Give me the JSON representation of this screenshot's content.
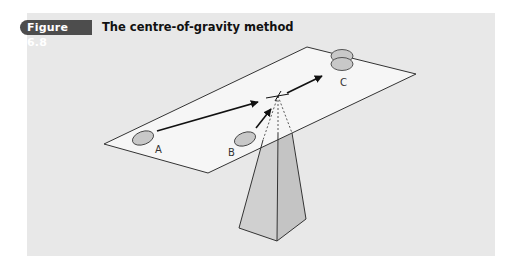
{
  "figure": {
    "label": "Figure 6.8",
    "title": "The centre-of-gravity method"
  },
  "diagram": {
    "points": [
      {
        "id": "A",
        "label": "A"
      },
      {
        "id": "B",
        "label": "B"
      },
      {
        "id": "C",
        "label": "C"
      }
    ],
    "colors": {
      "panel": "#e8e8e8",
      "badge": "#4d4d4d",
      "plane": "#f6f6f6",
      "site": "#c8c8c8",
      "pyramid_left": "#d0d0d0",
      "pyramid_right": "#c6c6c6",
      "line": "#222222"
    }
  }
}
